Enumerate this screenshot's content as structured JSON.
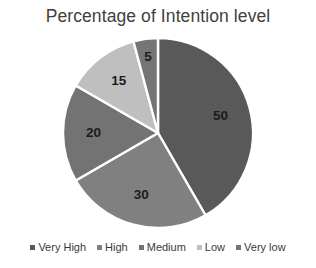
{
  "chart_data": {
    "type": "pie",
    "title": "Percentage of Intention level",
    "categories": [
      "Very High",
      "High",
      "Medium",
      "Low",
      "Very low"
    ],
    "values": [
      50,
      30,
      20,
      15,
      5
    ],
    "data_labels": [
      "50",
      "30",
      "20",
      "15",
      "5"
    ],
    "colors": [
      "#595959",
      "#808080",
      "#737373",
      "#bfbfbf",
      "#757575"
    ],
    "legend_position": "bottom",
    "grid": false,
    "xlabel": "",
    "ylabel": "",
    "start_angle_deg": 0,
    "direction": "clockwise",
    "slice_border_color": "#ffffff"
  },
  "legend": {
    "items": [
      {
        "label": "Very High",
        "color": "#595959"
      },
      {
        "label": "High",
        "color": "#808080"
      },
      {
        "label": "Medium",
        "color": "#737373"
      },
      {
        "label": "Low",
        "color": "#bfbfbf"
      },
      {
        "label": "Very low",
        "color": "#757575"
      }
    ]
  }
}
